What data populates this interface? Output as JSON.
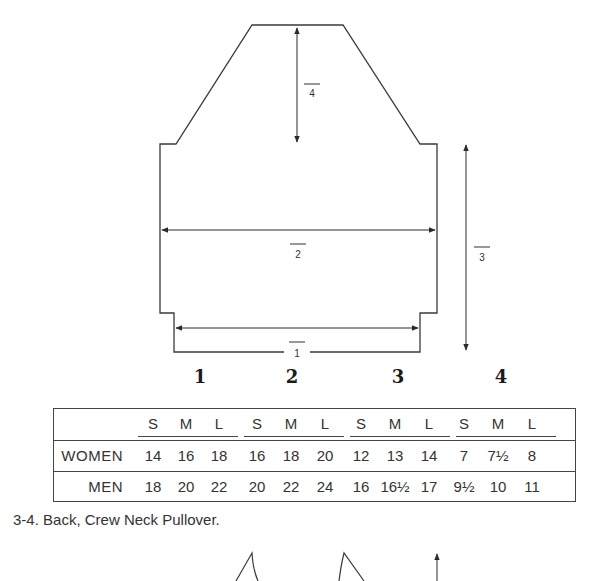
{
  "diagram": {
    "measure_labels": {
      "m1": "1",
      "m2": "2",
      "m3": "3",
      "m4": "4"
    }
  },
  "table": {
    "group_headers": [
      "1",
      "2",
      "3",
      "4"
    ],
    "size_headers": [
      "S",
      "M",
      "L",
      "S",
      "M",
      "L",
      "S",
      "M",
      "L",
      "S",
      "M",
      "L"
    ],
    "rows": [
      {
        "label": "WOMEN",
        "values": [
          "14",
          "16",
          "18",
          "16",
          "18",
          "20",
          "12",
          "13",
          "14",
          "7",
          "7½",
          "8"
        ]
      },
      {
        "label": "MEN",
        "values": [
          "18",
          "20",
          "22",
          "20",
          "22",
          "24",
          "16",
          "16½",
          "17",
          "9½",
          "10",
          "11"
        ]
      }
    ]
  },
  "caption": {
    "number": "3-4.",
    "text": "Back, Crew Neck Pullover."
  },
  "colors": {
    "line": "#3a3a3a",
    "text": "#333333",
    "background": "#ffffff"
  }
}
